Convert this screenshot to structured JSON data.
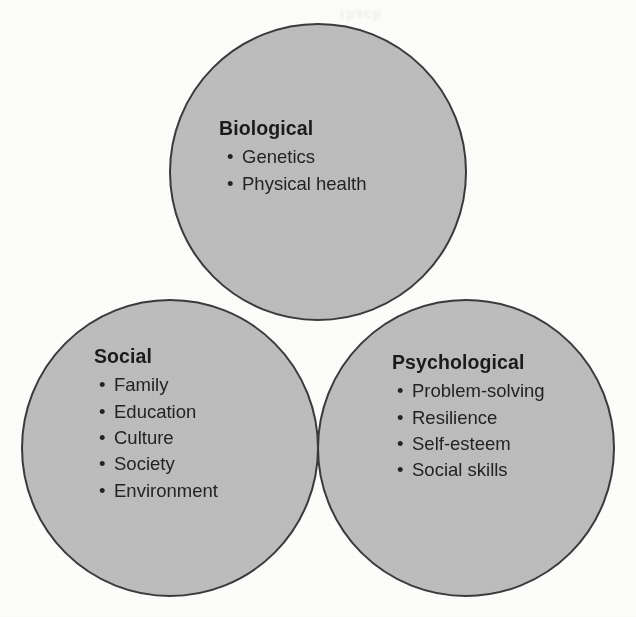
{
  "diagram": {
    "type": "venn-3-circle",
    "background_color": "#fdfdfc",
    "circle_fill_color": "#bdbdbd",
    "overlap_fill_color": "#a0a0a0",
    "stroke_color": "#3a3a3a",
    "text_color": "#1b1b1b",
    "bullet_glyph": "•",
    "scan_artifact_text": "thach",
    "groups": [
      {
        "key": "biological",
        "title": "Biological",
        "items": [
          "Genetics",
          "Physical health"
        ],
        "circle": {
          "cx": 318,
          "cy": 172,
          "r": 148
        }
      },
      {
        "key": "social",
        "title": "Social",
        "items": [
          "Family",
          "Education",
          "Culture",
          "Society",
          "Environment"
        ],
        "circle": {
          "cx": 170,
          "cy": 448,
          "r": 148
        }
      },
      {
        "key": "psychological",
        "title": "Psychological",
        "items": [
          "Problem-solving",
          "Resilience",
          "Self-esteem",
          "Social skills"
        ],
        "circle": {
          "cx": 466,
          "cy": 448,
          "r": 148
        }
      }
    ]
  }
}
